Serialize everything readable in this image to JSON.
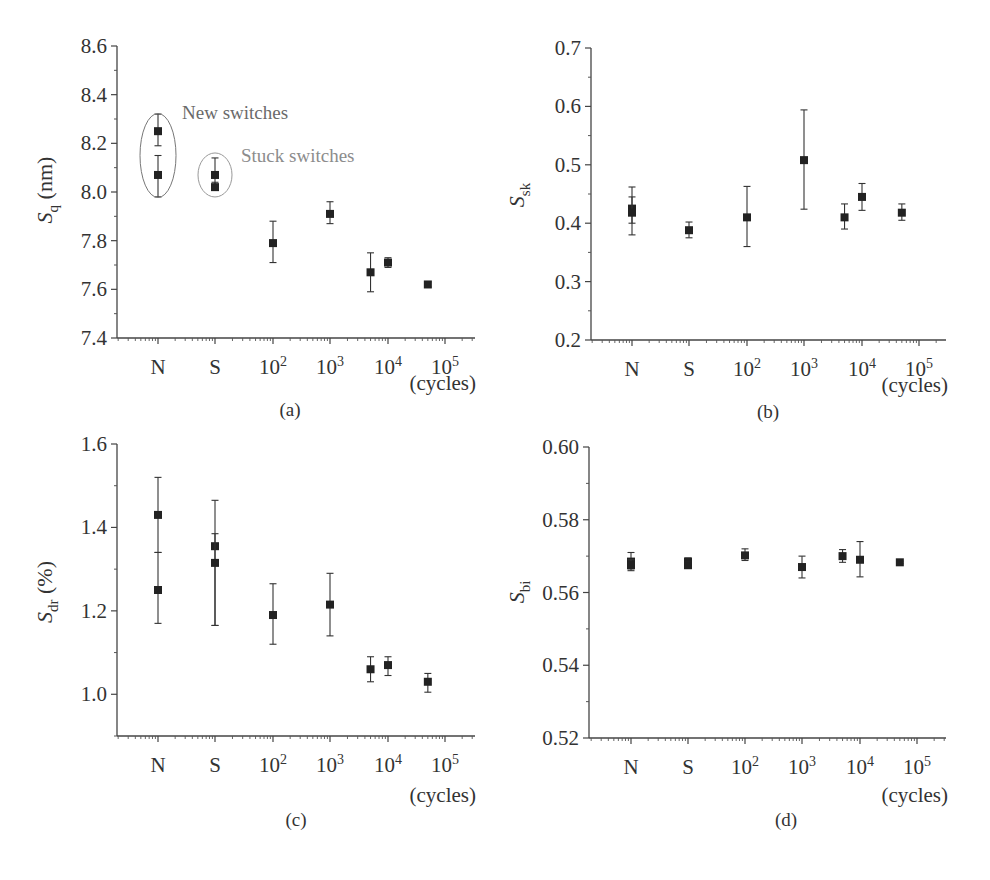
{
  "figure": {
    "x_tick_labels": [
      "N",
      "S",
      "10^2",
      "10^3",
      "10^4",
      "10^5"
    ],
    "x_unit_label": "(cycles)",
    "panels": [
      "(a)",
      "(b)",
      "(c)",
      "(d)"
    ]
  },
  "chart_data": [
    {
      "id": "a",
      "type": "scatter",
      "panel_label": "(a)",
      "ylabel": "Sq (nm)",
      "ylabel_main": "S",
      "ylabel_sub": "q",
      "ylabel_unit": " (nm)",
      "xlabel": "(cycles)",
      "x_tick_labels": [
        "N",
        "S",
        "10^2",
        "10^3",
        "10^4",
        "10^5"
      ],
      "ylim": [
        7.4,
        8.6
      ],
      "y_ticks": [
        7.4,
        7.6,
        7.8,
        8.0,
        8.2,
        8.4,
        8.6
      ],
      "y_tick_labels": [
        "7.4",
        "7.6",
        "7.8",
        "8.0",
        "8.2",
        "8.4",
        "8.6"
      ],
      "grid": false,
      "annotations": [
        {
          "text": "New switches",
          "encircles": "N"
        },
        {
          "text": "Stuck switches",
          "encircles": "S"
        }
      ],
      "points": [
        {
          "x": "N",
          "y": 8.25,
          "err_low": 8.19,
          "err_high": 8.32
        },
        {
          "x": "N",
          "y": 8.07,
          "err_low": 7.98,
          "err_high": 8.15
        },
        {
          "x": "S",
          "y": 8.07,
          "err_low": 8.03,
          "err_high": 8.14
        },
        {
          "x": "S",
          "y": 8.02,
          "err_low": 8.01,
          "err_high": 8.04
        },
        {
          "x": "1e2",
          "y": 7.79,
          "err_low": 7.71,
          "err_high": 7.88
        },
        {
          "x": "1e3",
          "y": 7.91,
          "err_low": 7.87,
          "err_high": 7.96
        },
        {
          "x": "5e3",
          "y": 7.67,
          "err_low": 7.59,
          "err_high": 7.75
        },
        {
          "x": "1e4",
          "y": 7.71,
          "err_low": 7.69,
          "err_high": 7.73
        },
        {
          "x": "5e4",
          "y": 7.62,
          "err_low": 7.61,
          "err_high": 7.63
        }
      ]
    },
    {
      "id": "b",
      "type": "scatter",
      "panel_label": "(b)",
      "ylabel": "Ssk",
      "ylabel_main": "S",
      "ylabel_sub": "sk",
      "ylabel_unit": "",
      "xlabel": "(cycles)",
      "x_tick_labels": [
        "N",
        "S",
        "10^2",
        "10^3",
        "10^4",
        "10^5"
      ],
      "ylim": [
        0.2,
        0.7
      ],
      "y_ticks": [
        0.2,
        0.3,
        0.4,
        0.5,
        0.6,
        0.7
      ],
      "y_tick_labels": [
        "0.2",
        "0.3",
        "0.4",
        "0.5",
        "0.6",
        "0.7"
      ],
      "grid": false,
      "points": [
        {
          "x": "N",
          "y": 0.425,
          "err_low": 0.38,
          "err_high": 0.462
        },
        {
          "x": "N",
          "y": 0.418,
          "err_low": 0.4,
          "err_high": 0.445
        },
        {
          "x": "S",
          "y": 0.388,
          "err_low": 0.375,
          "err_high": 0.402
        },
        {
          "x": "1e2",
          "y": 0.41,
          "err_low": 0.36,
          "err_high": 0.463
        },
        {
          "x": "1e3",
          "y": 0.508,
          "err_low": 0.424,
          "err_high": 0.594
        },
        {
          "x": "5e3",
          "y": 0.41,
          "err_low": 0.39,
          "err_high": 0.433
        },
        {
          "x": "1e4",
          "y": 0.445,
          "err_low": 0.422,
          "err_high": 0.468
        },
        {
          "x": "5e4",
          "y": 0.418,
          "err_low": 0.405,
          "err_high": 0.433
        }
      ]
    },
    {
      "id": "c",
      "type": "scatter",
      "panel_label": "(c)",
      "ylabel": "Sdr (%)",
      "ylabel_main": "S",
      "ylabel_sub": "dr",
      "ylabel_unit": " (%)",
      "xlabel": "(cycles)",
      "x_tick_labels": [
        "N",
        "S",
        "10^2",
        "10^3",
        "10^4",
        "10^5"
      ],
      "ylim": [
        0.9,
        1.6
      ],
      "y_ticks": [
        1.0,
        1.2,
        1.4,
        1.6
      ],
      "y_tick_labels": [
        "1.0",
        "1.2",
        "1.4",
        "1.6"
      ],
      "grid": false,
      "points": [
        {
          "x": "N",
          "y": 1.43,
          "err_low": 1.34,
          "err_high": 1.52
        },
        {
          "x": "N",
          "y": 1.25,
          "err_low": 1.17,
          "err_high": 1.34
        },
        {
          "x": "S",
          "y": 1.355,
          "err_low": 1.165,
          "err_high": 1.465
        },
        {
          "x": "S",
          "y": 1.315,
          "err_low": 1.165,
          "err_high": 1.385
        },
        {
          "x": "1e2",
          "y": 1.19,
          "err_low": 1.12,
          "err_high": 1.265
        },
        {
          "x": "1e3",
          "y": 1.215,
          "err_low": 1.14,
          "err_high": 1.29
        },
        {
          "x": "5e3",
          "y": 1.06,
          "err_low": 1.03,
          "err_high": 1.09
        },
        {
          "x": "1e4",
          "y": 1.07,
          "err_low": 1.045,
          "err_high": 1.09
        },
        {
          "x": "5e4",
          "y": 1.03,
          "err_low": 1.005,
          "err_high": 1.05
        }
      ]
    },
    {
      "id": "d",
      "type": "scatter",
      "panel_label": "(d)",
      "ylabel": "Sbi",
      "ylabel_main": "S",
      "ylabel_sub": "bi",
      "ylabel_unit": "",
      "xlabel": "(cycles)",
      "x_tick_labels": [
        "N",
        "S",
        "10^2",
        "10^3",
        "10^4",
        "10^5"
      ],
      "ylim": [
        0.52,
        0.6
      ],
      "y_ticks": [
        0.52,
        0.54,
        0.56,
        0.58,
        0.6
      ],
      "y_tick_labels": [
        "0.52",
        "0.54",
        "0.56",
        "0.58",
        "0.60"
      ],
      "grid": false,
      "points": [
        {
          "x": "N",
          "y": 0.5685,
          "err_low": 0.566,
          "err_high": 0.571
        },
        {
          "x": "N",
          "y": 0.5675,
          "err_low": 0.5665,
          "err_high": 0.569
        },
        {
          "x": "S",
          "y": 0.5685,
          "err_low": 0.567,
          "err_high": 0.5695
        },
        {
          "x": "S",
          "y": 0.5675,
          "err_low": 0.5668,
          "err_high": 0.5685
        },
        {
          "x": "1e2",
          "y": 0.5702,
          "err_low": 0.5688,
          "err_high": 0.572
        },
        {
          "x": "1e3",
          "y": 0.567,
          "err_low": 0.564,
          "err_high": 0.57
        },
        {
          "x": "5e3",
          "y": 0.57,
          "err_low": 0.5683,
          "err_high": 0.5718
        },
        {
          "x": "1e4",
          "y": 0.569,
          "err_low": 0.5643,
          "err_high": 0.574
        },
        {
          "x": "5e4",
          "y": 0.5683,
          "err_low": 0.568,
          "err_high": 0.5686
        }
      ]
    }
  ]
}
